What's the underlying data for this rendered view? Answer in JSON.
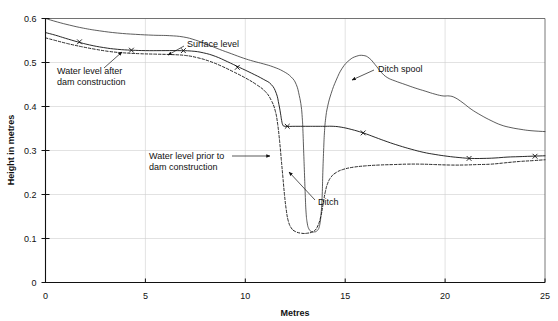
{
  "chart_data": {
    "type": "line",
    "title": "",
    "xlabel": "Metres",
    "ylabel": "Height in metres",
    "xlim": [
      0,
      25
    ],
    "ylim": [
      0,
      0.6
    ],
    "xticks": [
      "0",
      "5",
      "10",
      "15",
      "20",
      "25"
    ],
    "xtick_values": [
      0,
      5,
      10,
      15,
      20,
      25
    ],
    "yticks": [
      "0",
      "0.1",
      "0.2",
      "0.3",
      "0.4",
      "0.5",
      "0.6"
    ],
    "ytick_values": [
      0,
      0.1,
      0.2,
      0.3,
      0.4,
      0.5,
      0.6
    ],
    "grid": true,
    "legend": "none",
    "series": [
      {
        "name": "Surface level",
        "style": "solid-thin",
        "points": [
          [
            0.0,
            0.6
          ],
          [
            0.6,
            0.592
          ],
          [
            1.2,
            0.585
          ],
          [
            1.9,
            0.578
          ],
          [
            2.7,
            0.572
          ],
          [
            3.6,
            0.567
          ],
          [
            4.5,
            0.564
          ],
          [
            5.4,
            0.562
          ],
          [
            6.2,
            0.561
          ],
          [
            6.9,
            0.558
          ],
          [
            7.5,
            0.551
          ],
          [
            8.1,
            0.541
          ],
          [
            8.7,
            0.53
          ],
          [
            9.3,
            0.52
          ],
          [
            9.9,
            0.51
          ],
          [
            10.4,
            0.503
          ],
          [
            10.9,
            0.497
          ],
          [
            11.4,
            0.49
          ],
          [
            11.9,
            0.48
          ],
          [
            12.3,
            0.467
          ],
          [
            12.55,
            0.45
          ],
          [
            12.7,
            0.425
          ],
          [
            12.8,
            0.4
          ],
          [
            12.85,
            0.375
          ],
          [
            12.88,
            0.35
          ],
          [
            12.92,
            0.3
          ],
          [
            12.96,
            0.25
          ],
          [
            13.0,
            0.2
          ],
          [
            13.04,
            0.16
          ],
          [
            13.1,
            0.135
          ],
          [
            13.18,
            0.122
          ],
          [
            13.3,
            0.116
          ],
          [
            13.45,
            0.115
          ],
          [
            13.6,
            0.118
          ],
          [
            13.72,
            0.13
          ],
          [
            13.8,
            0.16
          ],
          [
            13.85,
            0.2
          ],
          [
            13.88,
            0.25
          ],
          [
            13.92,
            0.3
          ],
          [
            13.96,
            0.34
          ],
          [
            14.02,
            0.372
          ],
          [
            14.12,
            0.4
          ],
          [
            14.3,
            0.43
          ],
          [
            14.55,
            0.46
          ],
          [
            14.85,
            0.487
          ],
          [
            15.2,
            0.505
          ],
          [
            15.55,
            0.514
          ],
          [
            15.9,
            0.516
          ],
          [
            16.2,
            0.51
          ],
          [
            16.5,
            0.495
          ],
          [
            16.8,
            0.478
          ],
          [
            17.1,
            0.466
          ],
          [
            17.5,
            0.458
          ],
          [
            18.0,
            0.45
          ],
          [
            18.5,
            0.442
          ],
          [
            19.0,
            0.435
          ],
          [
            19.5,
            0.428
          ],
          [
            19.9,
            0.424
          ],
          [
            20.2,
            0.424
          ],
          [
            20.5,
            0.42
          ],
          [
            20.9,
            0.408
          ],
          [
            21.3,
            0.394
          ],
          [
            21.8,
            0.38
          ],
          [
            22.3,
            0.368
          ],
          [
            22.8,
            0.358
          ],
          [
            23.3,
            0.352
          ],
          [
            23.8,
            0.348
          ],
          [
            24.3,
            0.345
          ],
          [
            25.0,
            0.343
          ]
        ]
      },
      {
        "name": "Water level after dam construction",
        "style": "solid-marked",
        "points": [
          [
            0.0,
            0.568
          ],
          [
            0.5,
            0.562
          ],
          [
            1.0,
            0.555
          ],
          [
            1.6,
            0.547
          ],
          [
            2.2,
            0.54
          ],
          [
            2.9,
            0.534
          ],
          [
            3.6,
            0.53
          ],
          [
            4.3,
            0.528
          ],
          [
            5.0,
            0.527
          ],
          [
            5.8,
            0.527
          ],
          [
            6.6,
            0.527
          ],
          [
            7.3,
            0.526
          ],
          [
            7.9,
            0.522
          ],
          [
            8.5,
            0.514
          ],
          [
            9.1,
            0.502
          ],
          [
            9.7,
            0.489
          ],
          [
            10.3,
            0.476
          ],
          [
            10.9,
            0.462
          ],
          [
            11.3,
            0.45
          ],
          [
            11.55,
            0.43
          ],
          [
            11.68,
            0.405
          ],
          [
            11.76,
            0.385
          ],
          [
            11.82,
            0.368
          ],
          [
            11.88,
            0.358
          ],
          [
            12.0,
            0.355
          ],
          [
            12.5,
            0.355
          ],
          [
            13.0,
            0.355
          ],
          [
            13.5,
            0.355
          ],
          [
            14.0,
            0.355
          ],
          [
            14.4,
            0.355
          ],
          [
            14.8,
            0.353
          ],
          [
            15.3,
            0.348
          ],
          [
            15.9,
            0.34
          ],
          [
            16.5,
            0.33
          ],
          [
            17.1,
            0.32
          ],
          [
            17.7,
            0.311
          ],
          [
            18.3,
            0.303
          ],
          [
            18.9,
            0.296
          ],
          [
            19.5,
            0.291
          ],
          [
            20.1,
            0.287
          ],
          [
            20.7,
            0.284
          ],
          [
            21.3,
            0.282
          ],
          [
            21.9,
            0.282
          ],
          [
            22.5,
            0.283
          ],
          [
            23.1,
            0.285
          ],
          [
            23.7,
            0.286
          ],
          [
            24.3,
            0.287
          ],
          [
            25.0,
            0.288
          ]
        ],
        "markers_at_x": [
          1.7,
          4.3,
          6.9,
          9.6,
          12.1,
          15.9,
          21.2,
          24.5
        ]
      },
      {
        "name": "Water level prior to dam construction",
        "style": "dashed",
        "points": [
          [
            0.0,
            0.556
          ],
          [
            0.5,
            0.55
          ],
          [
            1.1,
            0.543
          ],
          [
            1.8,
            0.536
          ],
          [
            2.5,
            0.53
          ],
          [
            3.2,
            0.525
          ],
          [
            3.9,
            0.522
          ],
          [
            4.7,
            0.52
          ],
          [
            5.5,
            0.519
          ],
          [
            6.3,
            0.518
          ],
          [
            7.0,
            0.516
          ],
          [
            7.6,
            0.511
          ],
          [
            8.2,
            0.503
          ],
          [
            8.8,
            0.492
          ],
          [
            9.4,
            0.479
          ],
          [
            10.0,
            0.465
          ],
          [
            10.55,
            0.45
          ],
          [
            11.0,
            0.434
          ],
          [
            11.3,
            0.414
          ],
          [
            11.5,
            0.39
          ],
          [
            11.62,
            0.36
          ],
          [
            11.72,
            0.32
          ],
          [
            11.8,
            0.28
          ],
          [
            11.88,
            0.24
          ],
          [
            11.96,
            0.2
          ],
          [
            12.05,
            0.165
          ],
          [
            12.15,
            0.14
          ],
          [
            12.3,
            0.124
          ],
          [
            12.5,
            0.116
          ],
          [
            12.8,
            0.112
          ],
          [
            13.1,
            0.112
          ],
          [
            13.4,
            0.116
          ],
          [
            13.6,
            0.126
          ],
          [
            13.78,
            0.15
          ],
          [
            13.9,
            0.18
          ],
          [
            14.0,
            0.205
          ],
          [
            14.12,
            0.225
          ],
          [
            14.3,
            0.24
          ],
          [
            14.55,
            0.25
          ],
          [
            14.9,
            0.257
          ],
          [
            15.4,
            0.262
          ],
          [
            16.0,
            0.265
          ],
          [
            16.7,
            0.267
          ],
          [
            17.4,
            0.268
          ],
          [
            18.1,
            0.269
          ],
          [
            18.8,
            0.269
          ],
          [
            19.5,
            0.268
          ],
          [
            20.2,
            0.267
          ],
          [
            20.9,
            0.267
          ],
          [
            21.6,
            0.268
          ],
          [
            22.3,
            0.269
          ],
          [
            23.0,
            0.272
          ],
          [
            23.7,
            0.275
          ],
          [
            24.4,
            0.277
          ],
          [
            25.0,
            0.279
          ]
        ]
      }
    ],
    "annotations": [
      {
        "id": "surface-level",
        "text": "Surface level",
        "label_x": 187,
        "label_y": 47,
        "arrow_from_x": 184,
        "arrow_from_y": 46,
        "arrow_to_x": 168,
        "arrow_to_y": 55
      },
      {
        "id": "water-level-after",
        "text_line1": "Water level after",
        "text_line2": "dam construction",
        "label_x": 57,
        "label_y": 74,
        "arrow_from_x": 104,
        "arrow_from_y": 68,
        "arrow_to_x": 122,
        "arrow_to_y": 52
      },
      {
        "id": "water-level-prior",
        "text_line1": "Water level prior to",
        "text_line2": "dam construction",
        "label_x": 149,
        "label_y": 159,
        "arrow_from_x": 232,
        "arrow_from_y": 156,
        "arrow_to_x": 270,
        "arrow_to_y": 156
      },
      {
        "id": "ditch",
        "text": "Ditch",
        "label_x": 318,
        "label_y": 205,
        "arrow_from_x": 315,
        "arrow_from_y": 200,
        "arrow_to_x": 289,
        "arrow_to_y": 172
      },
      {
        "id": "ditch-spool",
        "text": "Ditch spool",
        "label_x": 378,
        "label_y": 72,
        "arrow_from_x": 374,
        "arrow_from_y": 70,
        "arrow_to_x": 352,
        "arrow_to_y": 80
      }
    ]
  }
}
